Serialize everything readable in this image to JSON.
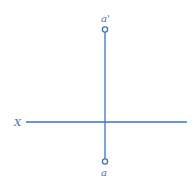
{
  "diagram": {
    "reference_line_label": "X",
    "points": [
      {
        "id": "front-view",
        "label": "a'"
      },
      {
        "id": "top-view",
        "label": "a"
      }
    ],
    "colors": {
      "line": "#3a73c4",
      "text": "#3a73c4",
      "background": "#ffffff"
    }
  }
}
